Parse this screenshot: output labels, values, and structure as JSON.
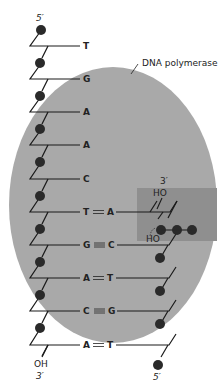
{
  "colors": {
    "background": "#ffffff",
    "enzyme": "#a9a9a9",
    "active_site": "#8f8f8f",
    "strand": "#1a1a1a",
    "phosphate": "#2a2a2a"
  },
  "labels": {
    "enzyme": "DNA polymerase",
    "template_top": "5′",
    "template_bottom": "3′",
    "template_bottom_group": "OH",
    "new_top": "3′",
    "new_top_group": "HO",
    "new_bottom": "5′",
    "incoming_group": "HO"
  },
  "template_bases": [
    "T",
    "G",
    "A",
    "A",
    "C",
    "T",
    "G",
    "A",
    "C",
    "A"
  ],
  "pairs": [
    {
      "template": "T",
      "new": "A",
      "bond": "double"
    },
    {
      "template": "G",
      "new": "C",
      "bond": "triple"
    },
    {
      "template": "A",
      "new": "T",
      "bond": "double"
    },
    {
      "template": "C",
      "new": "G",
      "bond": "triple"
    },
    {
      "template": "A",
      "new": "T",
      "bond": "double"
    }
  ]
}
